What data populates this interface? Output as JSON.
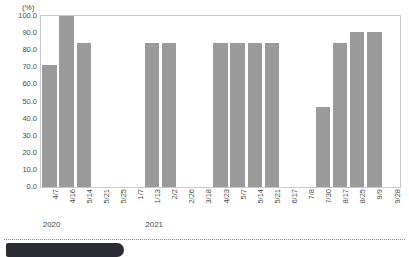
{
  "chart_data": {
    "type": "bar",
    "title": "",
    "subtitle": "",
    "xlabel": "",
    "ylabel": "",
    "unit_label": "(%)",
    "ylim": [
      0.0,
      100.0
    ],
    "ytick_step": 10.0,
    "yticks": [
      "0.0",
      "10.0",
      "20.0",
      "30.0",
      "40.0",
      "50.0",
      "60.0",
      "70.0",
      "80.0",
      "90.0",
      "100.0"
    ],
    "grid": false,
    "legend": "none",
    "bar_color": "#9a9a9a",
    "frame_color": "#c9c9c9",
    "categories": [
      "4/7",
      "4/16",
      "5/14",
      "5/21",
      "5/25",
      "1/7",
      "1/13",
      "2/2",
      "2/26",
      "3/18",
      "4/23",
      "5/7",
      "5/14",
      "5/21",
      "6/17",
      "7/8",
      "7/30",
      "8/17",
      "8/25",
      "9/9",
      "9/28"
    ],
    "values": [
      71.5,
      100.0,
      84.0,
      null,
      null,
      null,
      84.0,
      84.0,
      null,
      null,
      84.0,
      84.0,
      84.0,
      84.0,
      null,
      null,
      47.0,
      84.0,
      90.5,
      90.5,
      null
    ],
    "group_labels": [
      {
        "text": "2020",
        "index": 0
      },
      {
        "text": "2021",
        "index": 6
      }
    ]
  },
  "footer": {
    "separator": "dotted-rule",
    "chip": "cut-off-banner"
  }
}
